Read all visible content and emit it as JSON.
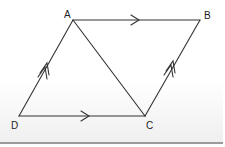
{
  "diagram": {
    "points": {
      "A": {
        "label": "A",
        "x": 73,
        "y": 20
      },
      "B": {
        "label": "B",
        "x": 200,
        "y": 20
      },
      "C": {
        "label": "C",
        "x": 145,
        "y": 116
      },
      "D": {
        "label": "D",
        "x": 19,
        "y": 116
      }
    },
    "segments": [
      {
        "from": "A",
        "to": "B",
        "marker": "single-arrow"
      },
      {
        "from": "D",
        "to": "C",
        "marker": "single-arrow"
      },
      {
        "from": "D",
        "to": "A",
        "marker": "double-arrow"
      },
      {
        "from": "C",
        "to": "B",
        "marker": "double-arrow"
      },
      {
        "from": "A",
        "to": "C",
        "marker": "none"
      }
    ],
    "line_color": "#333333"
  }
}
